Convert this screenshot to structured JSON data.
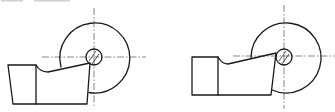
{
  "figure": {
    "colors": {
      "line": "#1a1a1a",
      "centerline": "#555555",
      "background": "#ffffff"
    },
    "views": [
      {
        "id": "left",
        "shank": {
          "x_top_left": 8,
          "x_bottom_left": 13,
          "x_right": 36,
          "y_top": 65,
          "y_bottom": 104
        },
        "tool": {
          "curve_start": [
            36,
            65
          ],
          "curve_end": [
            48,
            72
          ],
          "top_end": [
            90,
            63
          ],
          "right_bottom": [
            87,
            104
          ]
        },
        "workpiece": {
          "cx": 95,
          "cy": 58,
          "r": 35,
          "arc_start": [
            61,
            67
          ],
          "arc_end": [
            89,
            92
          ]
        },
        "pin": {
          "cx": 94,
          "cy": 57,
          "r": 8
        },
        "centerlines": {
          "vertical_x": 94,
          "vertical_y": [
            8,
            108
          ],
          "horizontal_y": 57,
          "horizontal_x": [
            42,
            146
          ]
        }
      },
      {
        "id": "right",
        "shank": {
          "x_top_left": 192,
          "x_bottom_left": 192,
          "x_right": 218,
          "y_top": 57,
          "y_bottom": 95
        },
        "tool": {
          "curve_start": [
            218,
            57
          ],
          "curve_end": [
            228,
            64
          ],
          "top_end": [
            276,
            53
          ],
          "right_bottom": [
            271,
            95
          ]
        },
        "workpiece": {
          "cx": 284,
          "cy": 57,
          "r": 35,
          "arc_start": [
            251,
            58
          ],
          "arc_end": [
            272,
            90
          ]
        },
        "pin": {
          "cx": 284,
          "cy": 57,
          "r": 8
        },
        "centerlines": {
          "vertical_x": 284,
          "vertical_y": [
            5,
            109
          ],
          "horizontal_y": 56,
          "horizontal_x": [
            233,
            334
          ]
        }
      }
    ]
  }
}
